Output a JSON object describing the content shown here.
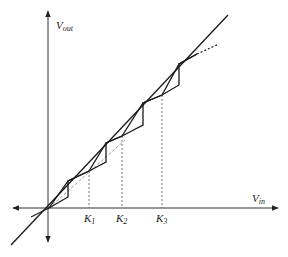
{
  "diagram": {
    "axes": {
      "x_label": "V",
      "x_sub": "in",
      "y_label": "V",
      "y_sub": "out"
    },
    "ticks": [
      {
        "label": "K",
        "sub": "1"
      },
      {
        "label": "K",
        "sub": "2"
      },
      {
        "label": "K",
        "sub": "3"
      }
    ],
    "colors": {
      "line": "#1a1a1a",
      "axis": "#333333",
      "dashed": "#777777",
      "ideal_dashed": "#999999"
    }
  }
}
